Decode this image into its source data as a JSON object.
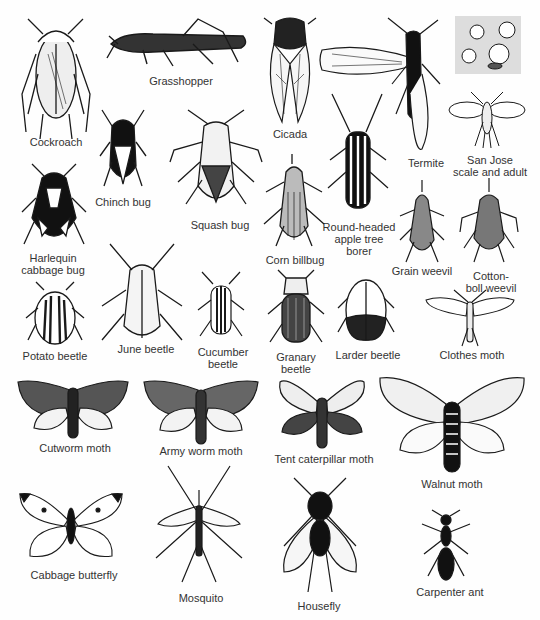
{
  "plate": {
    "kind": "insect identification illustration",
    "background": "#ffffff",
    "ink": "#1a1a1a"
  },
  "insects": [
    {
      "id": "cockroach",
      "label": "Cockroach"
    },
    {
      "id": "grasshopper",
      "label": "Grasshopper"
    },
    {
      "id": "cicada",
      "label": "Cicada"
    },
    {
      "id": "termite",
      "label": "Termite"
    },
    {
      "id": "san-jose-scale",
      "label": "San Jose\nscale and adult"
    },
    {
      "id": "chinch-bug",
      "label": "Chinch bug"
    },
    {
      "id": "squash-bug",
      "label": "Squash bug"
    },
    {
      "id": "round-headed-apple-tree-borer",
      "label": "Round-headed\napple tree\nborer"
    },
    {
      "id": "harlequin-cabbage-bug",
      "label": "Harlequin\ncabbage bug"
    },
    {
      "id": "corn-billbug",
      "label": "Corn billbug"
    },
    {
      "id": "grain-weevil",
      "label": "Grain weevil"
    },
    {
      "id": "cotton-boll-weevil",
      "label": "Cotton-\nboll weevil"
    },
    {
      "id": "potato-beetle",
      "label": "Potato beetle"
    },
    {
      "id": "june-beetle",
      "label": "June beetle"
    },
    {
      "id": "cucumber-beetle",
      "label": "Cucumber\nbeetle"
    },
    {
      "id": "granary-beetle",
      "label": "Granary\nbeetle"
    },
    {
      "id": "larder-beetle",
      "label": "Larder beetle"
    },
    {
      "id": "clothes-moth",
      "label": "Clothes moth"
    },
    {
      "id": "cutworm-moth",
      "label": "Cutworm moth"
    },
    {
      "id": "army-worm-moth",
      "label": "Army worm moth"
    },
    {
      "id": "tent-caterpillar-moth",
      "label": "Tent caterpillar moth"
    },
    {
      "id": "walnut-moth",
      "label": "Walnut moth"
    },
    {
      "id": "cabbage-butterfly",
      "label": "Cabbage butterfly"
    },
    {
      "id": "mosquito",
      "label": "Mosquito"
    },
    {
      "id": "housefly",
      "label": "Housefly"
    },
    {
      "id": "carpenter-ant",
      "label": "Carpenter ant"
    }
  ]
}
